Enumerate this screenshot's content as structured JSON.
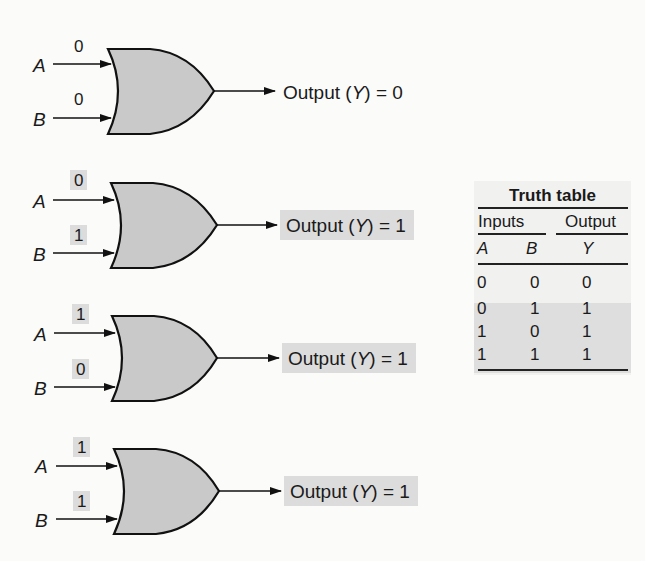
{
  "figure": {
    "gates": [
      {
        "input_a_label": "A",
        "input_b_label": "B",
        "input_a_value": "0",
        "input_b_value": "0",
        "output_text_prefix": "Output (",
        "output_var": "Y",
        "output_text_suffix": ") = 0",
        "output_value": "0",
        "highlighted": false
      },
      {
        "input_a_label": "A",
        "input_b_label": "B",
        "input_a_value": "0",
        "input_b_value": "1",
        "output_text_prefix": "Output (",
        "output_var": "Y",
        "output_text_suffix": ") = 1",
        "output_value": "1",
        "highlighted": true
      },
      {
        "input_a_label": "A",
        "input_b_label": "B",
        "input_a_value": "1",
        "input_b_value": "0",
        "output_text_prefix": "Output (",
        "output_var": "Y",
        "output_text_suffix": ") = 1",
        "output_value": "1",
        "highlighted": true
      },
      {
        "input_a_label": "A",
        "input_b_label": "B",
        "input_a_value": "1",
        "input_b_value": "1",
        "output_text_prefix": "Output (",
        "output_var": "Y",
        "output_text_suffix": ") = 1",
        "output_value": "1",
        "highlighted": true
      }
    ],
    "truth_table": {
      "title": "Truth table",
      "group_inputs": "Inputs",
      "group_output": "Output",
      "columns": [
        "A",
        "B",
        "Y"
      ],
      "rows": [
        [
          "0",
          "0",
          "0"
        ],
        [
          "0",
          "1",
          "1"
        ],
        [
          "1",
          "0",
          "1"
        ],
        [
          "1",
          "1",
          "1"
        ]
      ]
    },
    "colors": {
      "gate_fill": "#c9c9c9",
      "gate_stroke": "#111111",
      "highlight": "#dcdcdc",
      "table_bg": "#f1f1f0",
      "background": "#fbfbfa"
    }
  }
}
